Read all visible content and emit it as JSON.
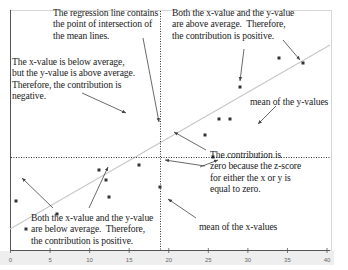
{
  "colors": {
    "frame": "#d6d6d6",
    "axis": "#555555",
    "mean_line": "#333333",
    "regression": "#c8c8c8",
    "point": "#333333",
    "arrow": "#444444",
    "text": "#1a1a1a",
    "axis_band": "#eeeeee"
  },
  "annotations": {
    "regression_note": "The regression line contains\nthe point of intersection of\nthe mean lines.",
    "quadrant_upper_left": "The x-value is below average,\nbut the y-value is above average.\nTherefore, the contribution is\nnegative.",
    "quadrant_upper_right": "Both the x-value and the y-value\nare above average.  Therefore,\nthe contribution is positive.",
    "mean_y_label": "mean of the y-values",
    "zero_note": "The contribution is\nzero because the z-score\nfor either the x or y is\nequal to zero.",
    "quadrant_lower_left": "Both the x-value and the y-value\nare below average.  Therefore,\nthe contribution is positive.",
    "mean_x_label": "mean of the x-values"
  },
  "chart_data": {
    "type": "scatter",
    "title": "",
    "xlabel": "",
    "ylabel": "",
    "xlim": [
      0,
      40
    ],
    "xticks": [
      0,
      5,
      10,
      15,
      20,
      25,
      30,
      35,
      40
    ],
    "xtick_labels": [
      "0",
      "5",
      "10",
      "15",
      "20",
      "25",
      "30",
      "35",
      "40"
    ],
    "grid": false,
    "legend": "none",
    "mean_x": 19,
    "mean_y_pixel": 157,
    "points_px": [
      [
        16,
        201
      ],
      [
        26,
        229
      ],
      [
        57,
        214
      ],
      [
        106,
        180
      ],
      [
        109,
        197
      ],
      [
        139,
        165
      ],
      [
        99,
        170
      ],
      [
        160,
        187
      ],
      [
        213,
        157
      ],
      [
        205,
        135
      ],
      [
        219,
        119
      ],
      [
        230,
        119
      ],
      [
        240,
        87
      ],
      [
        279,
        58
      ],
      [
        303,
        63
      ]
    ],
    "regression_line_px": [
      [
        10,
        229
      ],
      [
        330,
        45
      ]
    ],
    "mean_x_line_px": 160,
    "mean_y_line_px": 157
  }
}
